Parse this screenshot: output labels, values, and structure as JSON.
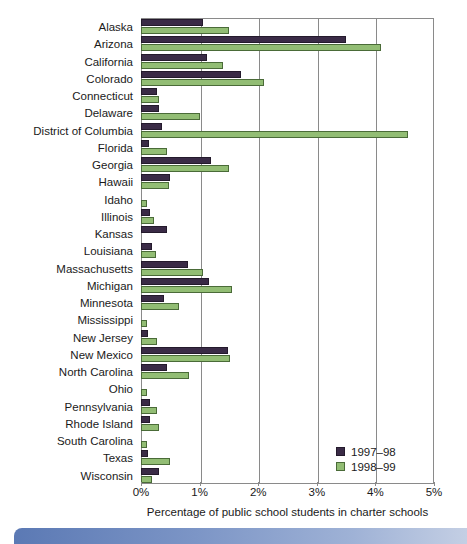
{
  "chart_data": {
    "type": "bar",
    "orientation": "horizontal",
    "title": "",
    "xlabel": "Percentage of public school students in charter schools",
    "ylabel": "",
    "xlim": [
      0,
      5
    ],
    "xticks": [
      "0%",
      "1%",
      "2%",
      "3%",
      "4%",
      "5%"
    ],
    "xtick_values": [
      0,
      1,
      2,
      3,
      4,
      5
    ],
    "grid": true,
    "legend_position": "inside-bottom-right",
    "categories": [
      "Alaska",
      "Arizona",
      "California",
      "Colorado",
      "Connecticut",
      "Delaware",
      "District of Columbia",
      "Florida",
      "Georgia",
      "Hawaii",
      "Idaho",
      "Illinois",
      "Kansas",
      "Louisiana",
      "Massachusetts",
      "Michigan",
      "Minnesota",
      "Mississippi",
      "New Jersey",
      "New Mexico",
      "North Carolina",
      "Ohio",
      "Pennsylvania",
      "Rhode Island",
      "South Carolina",
      "Texas",
      "Wisconsin"
    ],
    "series": [
      {
        "name": "1997-98",
        "color": "#3a2b46",
        "values": [
          1.05,
          3.5,
          1.12,
          1.7,
          0.28,
          0.3,
          0.36,
          0.14,
          1.2,
          0.5,
          0.0,
          0.16,
          0.45,
          0.18,
          0.8,
          1.16,
          0.4,
          0.0,
          0.12,
          1.48,
          0.45,
          0.0,
          0.16,
          0.16,
          0.0,
          0.12,
          0.3
        ]
      },
      {
        "name": "1998-99",
        "color": "#92bd74",
        "values": [
          1.5,
          4.1,
          1.4,
          2.1,
          0.3,
          1.0,
          4.55,
          0.45,
          1.5,
          0.48,
          0.1,
          0.22,
          0.0,
          0.25,
          1.05,
          1.55,
          0.65,
          0.1,
          0.28,
          1.52,
          0.82,
          0.1,
          0.28,
          0.3,
          0.1,
          0.5,
          0.18
        ]
      }
    ],
    "legend": [
      {
        "label": "1997–98",
        "swatch": "s97"
      },
      {
        "label": "1998–99",
        "swatch": "s98"
      }
    ]
  },
  "colors": {
    "series_1997_98": "#3a2b46",
    "series_1998_99": "#92bd74",
    "axis": "#8a8a8a",
    "text": "#1a1a1a",
    "band": "#5b79b4"
  }
}
